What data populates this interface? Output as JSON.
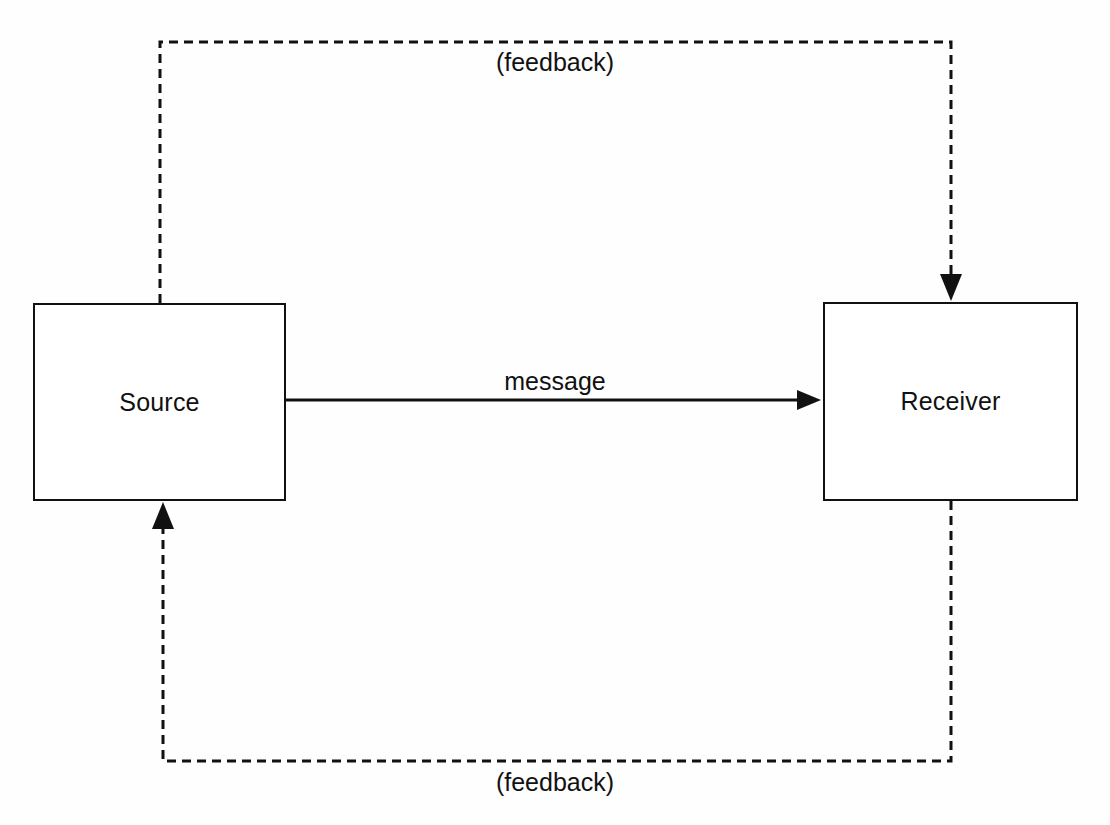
{
  "diagram": {
    "background_color": "#fefefe",
    "stroke_color": "#111111",
    "nodes": [
      {
        "id": "source",
        "label": "Source",
        "x": 33,
        "y": 303,
        "width": 253,
        "height": 198
      },
      {
        "id": "receiver",
        "label": "Receiver",
        "x": 823,
        "y": 302,
        "width": 255,
        "height": 199
      }
    ],
    "edges": [
      {
        "id": "message",
        "label": "message",
        "from": "source",
        "to": "receiver",
        "style": "solid",
        "arrowhead": "to"
      },
      {
        "id": "feedback-top",
        "label": "(feedback)",
        "from": "source",
        "to": "receiver",
        "style": "dashed",
        "arrowhead": "to",
        "routing": "over-the-top"
      },
      {
        "id": "feedback-bottom",
        "label": "(feedback)",
        "from": "receiver",
        "to": "source",
        "style": "dashed",
        "arrowhead": "to",
        "routing": "under-the-bottom"
      }
    ]
  }
}
